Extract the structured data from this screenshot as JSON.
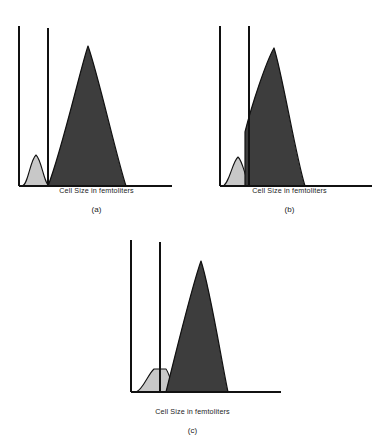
{
  "figure": {
    "background_color": "#ffffff",
    "axis_color": "#111111",
    "dark_peak_color": "#3d3d3d",
    "dark_peak_stroke": "#111111",
    "light_peak_color": "#c8c8c8",
    "light_peak_stroke": "#111111",
    "panels": [
      {
        "id": "a",
        "label": "(a)",
        "xlabel": "Cell Size in femtoliters",
        "axis": {
          "x0": 19,
          "y_baseline": 186,
          "x_end": 172,
          "y_top": 26,
          "gate_x": 48,
          "gate_y_top": 28
        },
        "light_peak": {
          "start": 22,
          "peak_x": 36,
          "peak_y": 155,
          "end": 50,
          "top_flat": 0
        },
        "dark_peak": {
          "start": 48,
          "peak_x": 88,
          "peak_y": 46,
          "end": 126
        }
      },
      {
        "id": "b",
        "label": "(b)",
        "xlabel": "Cell Size in femtoliters",
        "axis": {
          "x0": 220,
          "y_baseline": 186,
          "x_end": 372,
          "y_top": 26,
          "gate_x": 249,
          "gate_y_top": 26
        },
        "light_peak": {
          "start": 222,
          "peak_x": 238,
          "peak_y": 157,
          "end": 252,
          "top_flat": 0
        },
        "dark_peak": {
          "start": 245,
          "peak_x": 274,
          "peak_y": 48,
          "end": 305
        }
      },
      {
        "id": "c",
        "label": "(c)",
        "xlabel": "Cell Size in femtoliters",
        "axis": {
          "x0": 131,
          "y_baseline": 392,
          "x_end": 281,
          "y_top": 240,
          "gate_x": 160,
          "gate_y_top": 242
        },
        "light_peak": {
          "start": 136,
          "peak_x": 159,
          "peak_y": 368,
          "end": 175,
          "top_flat": 10
        },
        "dark_peak": {
          "start": 166,
          "peak_x": 201,
          "peak_y": 261,
          "end": 228
        }
      }
    ]
  }
}
